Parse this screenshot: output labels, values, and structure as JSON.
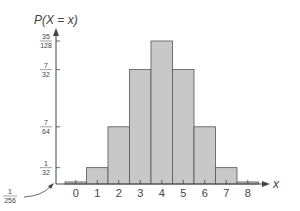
{
  "chart_data": {
    "type": "bar",
    "title": "",
    "ylabel": "P(X = x)",
    "xlabel": "x",
    "categories": [
      "0",
      "1",
      "2",
      "3",
      "4",
      "5",
      "6",
      "7",
      "8"
    ],
    "values": [
      0.00390625,
      0.03125,
      0.109375,
      0.21875,
      0.2734375,
      0.21875,
      0.109375,
      0.03125,
      0.00390625
    ],
    "value_labels": [
      "1/256",
      "1/32",
      "7/64",
      "7/32",
      "35/128",
      "7/32",
      "7/64",
      "1/32",
      "1/256"
    ],
    "y_ticks": [
      {
        "num": "1",
        "den": "32",
        "value": 0.03125
      },
      {
        "num": "7",
        "den": "64",
        "value": 0.109375
      },
      {
        "num": "7",
        "den": "32",
        "value": 0.21875
      },
      {
        "num": "35",
        "den": "128",
        "value": 0.2734375
      }
    ],
    "annotation": {
      "num": "1",
      "den": "256",
      "value": 0.00390625
    },
    "ylim": [
      0,
      0.3
    ],
    "grid": false,
    "bar_color": "#c8c8c8",
    "edge_color": "#555555"
  }
}
